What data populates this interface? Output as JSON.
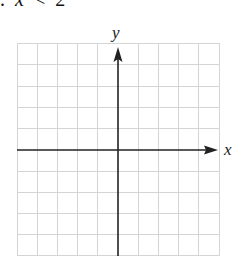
{
  "problem": {
    "bullet": ".",
    "variable": "x",
    "relation": "<",
    "value": "2"
  },
  "graph": {
    "x_axis_label": "x",
    "y_axis_label": "y",
    "grid_columns": 10,
    "grid_rows": 10,
    "grid_color": "#d4d4d4",
    "axis_color": "#222222"
  }
}
